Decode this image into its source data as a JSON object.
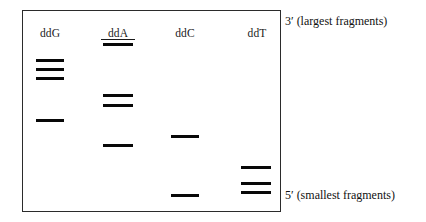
{
  "figure": {
    "box": {
      "x": 22,
      "y": 10,
      "width": 259,
      "height": 202,
      "border_color": "#2b2b2b"
    },
    "band_color": "#080808",
    "lanes": [
      {
        "id": "lane-ddg",
        "label": "ddG",
        "underlined": false,
        "label_x": 34,
        "label_y": 27,
        "band_x": 36,
        "band_width": 28,
        "bands": [
          {
            "y": 59
          },
          {
            "y": 68
          },
          {
            "y": 77
          },
          {
            "y": 119
          }
        ]
      },
      {
        "id": "lane-dda",
        "label": "ddA",
        "underlined": true,
        "label_x": 101,
        "label_y": 27,
        "band_x": 103,
        "band_width": 30,
        "bands": [
          {
            "y": 43
          },
          {
            "y": 94
          },
          {
            "y": 104
          },
          {
            "y": 144
          }
        ]
      },
      {
        "id": "lane-ddc",
        "label": "ddC",
        "underlined": false,
        "label_x": 169,
        "label_y": 27,
        "band_x": 171,
        "band_width": 28,
        "bands": [
          {
            "y": 135
          },
          {
            "y": 194
          }
        ]
      },
      {
        "id": "lane-ddt",
        "label": "ddT",
        "underlined": false,
        "label_x": 240,
        "label_y": 27,
        "band_x": 241,
        "band_width": 30,
        "bands": [
          {
            "y": 166
          },
          {
            "y": 182
          },
          {
            "y": 191
          }
        ]
      }
    ],
    "annotations": {
      "top_right": {
        "text": "3′ (largest fragments)",
        "x": 285,
        "y": 15
      },
      "bottom_right": {
        "text": "5′ (smallest fragments)",
        "x": 285,
        "y": 189
      }
    }
  }
}
